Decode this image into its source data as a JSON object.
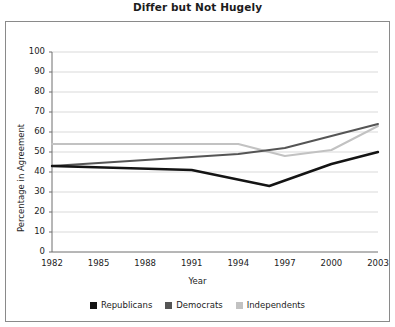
{
  "chart_data": {
    "type": "line",
    "title": "Differ but Not Hugely",
    "xlabel": "Year",
    "ylabel": "Percentage in Agreement",
    "xlim": [
      1982,
      2003
    ],
    "ylim": [
      0,
      100
    ],
    "grid": true,
    "legend_position": "bottom",
    "xticks": [
      "1982",
      "1985",
      "1988",
      "1991",
      "1994",
      "1997",
      "2000",
      "2003"
    ],
    "yticks": [
      "0",
      "10",
      "20",
      "30",
      "40",
      "50",
      "60",
      "70",
      "80",
      "90",
      "100"
    ],
    "series": [
      {
        "name": "Republicans",
        "color": "#141414",
        "x": [
          1982,
          1991,
          1996,
          2000,
          2003
        ],
        "values": [
          43,
          41,
          33,
          44,
          50
        ]
      },
      {
        "name": "Democrats",
        "color": "#555555",
        "x": [
          1982,
          1994,
          1997,
          2003
        ],
        "values": [
          43,
          49,
          52,
          64
        ]
      },
      {
        "name": "Independents",
        "color": "#c2c2c2",
        "x": [
          1982,
          1991,
          1994,
          1997,
          2000,
          2003
        ],
        "values": [
          54,
          54,
          54,
          48,
          51,
          63
        ]
      }
    ]
  },
  "legend": {
    "entries": [
      {
        "label": "Republicans",
        "color": "#141414"
      },
      {
        "label": "Democrats",
        "color": "#555555"
      },
      {
        "label": "Independents",
        "color": "#c2c2c2"
      }
    ]
  }
}
